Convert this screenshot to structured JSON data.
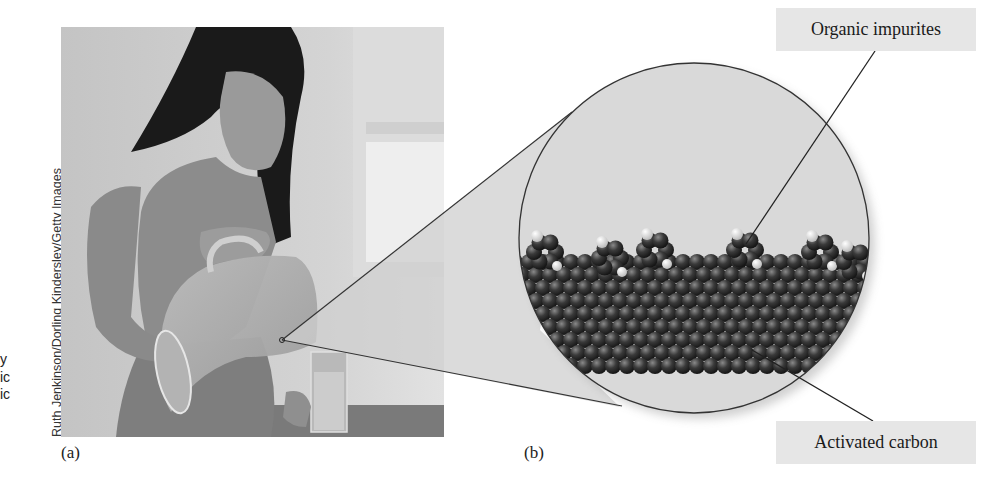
{
  "figure": {
    "panel_a_label": "(a)",
    "panel_b_label": "(b)",
    "photo_credit": "Ruth Jenkinson/Dorling Kindersley/Getty Images",
    "left_margin_fragments": [
      "y",
      "ic",
      "ic"
    ],
    "callouts": {
      "top": "Organic impurites",
      "bottom": "Activated carbon"
    },
    "colors": {
      "callout_bg": "#e6e6e6",
      "cone_fill": "#cfcfcf",
      "circle_fill": "#d9d9d9",
      "carbon_atom": "#2e2e2e",
      "hydrogen_atom": "#e8e8e8"
    }
  }
}
